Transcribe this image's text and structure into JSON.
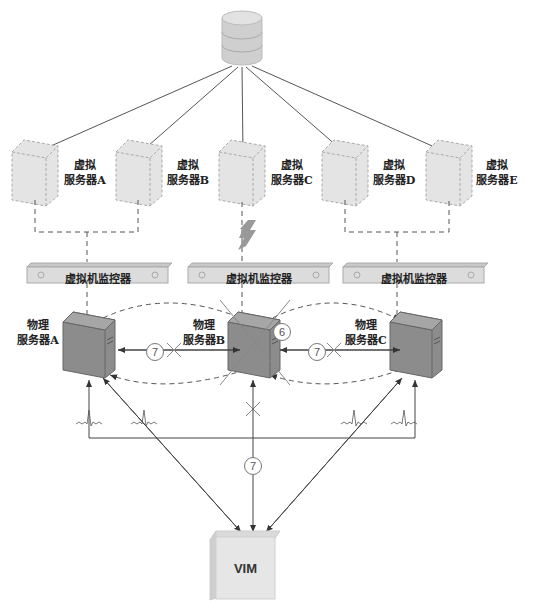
{
  "diagram": {
    "storage": {
      "icon": "database-icon"
    },
    "virtual_servers": [
      {
        "line1": "虚拟",
        "line2": "服务器A"
      },
      {
        "line1": "虚拟",
        "line2": "服务器B"
      },
      {
        "line1": "虚拟",
        "line2": "服务器C"
      },
      {
        "line1": "虚拟",
        "line2": "服务器D"
      },
      {
        "line1": "虚拟",
        "line2": "服务器E"
      }
    ],
    "hypervisors": [
      {
        "label": "虚拟机监控器"
      },
      {
        "label": "虚拟机监控器"
      },
      {
        "label": "虚拟机监控器"
      }
    ],
    "physical_servers": [
      {
        "line1": "物理",
        "line2": "服务器A"
      },
      {
        "line1": "物理",
        "line2": "服务器B",
        "status": "failed"
      },
      {
        "line1": "物理",
        "line2": "服务器C"
      }
    ],
    "markers": {
      "step6": "6",
      "step7_left": "7",
      "step7_right": "7",
      "step7_vim": "7"
    },
    "vim": {
      "label": "VIM"
    },
    "colors": {
      "physical_server": "#8c8c8c",
      "virtual_server": "#e4e4e4",
      "hypervisor": "#dcdcdc",
      "line": "#444444",
      "dashed": "#555555"
    }
  }
}
